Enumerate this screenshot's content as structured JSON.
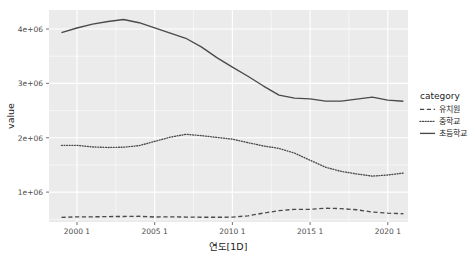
{
  "chart_data": {
    "type": "line",
    "title": "",
    "xlabel": "연도[1D]",
    "ylabel": "value",
    "legend_title": "category",
    "legend_position": "right",
    "grid": true,
    "xlim": [
      1998.2,
      2021.3
    ],
    "ylim": [
      450000,
      4350000
    ],
    "x_ticks": [
      2000,
      2005,
      2010,
      2015,
      2020
    ],
    "x_tick_labels": [
      "2000 1",
      "2005 1",
      "2010 1",
      "2015 1",
      "2020 1"
    ],
    "y_ticks": [
      1000000,
      2000000,
      3000000,
      4000000
    ],
    "y_tick_labels": [
      "1e+06",
      "2e+06",
      "3e+06",
      "4e+06"
    ],
    "x": [
      1999,
      2000,
      2001,
      2002,
      2003,
      2004,
      2005,
      2006,
      2007,
      2008,
      2009,
      2010,
      2011,
      2012,
      2013,
      2014,
      2015,
      2016,
      2017,
      2018,
      2019,
      2020,
      2021
    ],
    "series": [
      {
        "name": "유치원",
        "style": "dashed",
        "color": "#4a4a4a",
        "values": [
          534000,
          545000,
          545000,
          550000,
          552000,
          555000,
          542000,
          545000,
          541000,
          538000,
          537000,
          539000,
          564000,
          614000,
          658000,
          683000,
          683000,
          704000,
          695000,
          675000,
          634000,
          612000,
          602000
        ]
      },
      {
        "name": "중학교",
        "style": "dotted",
        "color": "#4a4a4a",
        "values": [
          1860000,
          1860000,
          1831000,
          1821000,
          1826000,
          1855000,
          1933000,
          2010000,
          2063000,
          2039000,
          2006000,
          1974000,
          1910000,
          1849000,
          1804000,
          1717000,
          1586000,
          1457000,
          1381000,
          1334000,
          1294000,
          1315000,
          1350000
        ]
      },
      {
        "name": "초등학교",
        "style": "solid",
        "color": "#4a4a4a",
        "values": [
          3935000,
          4019000,
          4089000,
          4138000,
          4175000,
          4116000,
          4022000,
          3925000,
          3830000,
          3672000,
          3474000,
          3299000,
          3132000,
          2951000,
          2784000,
          2729000,
          2714000,
          2673000,
          2674000,
          2711000,
          2747000,
          2693000,
          2672000
        ]
      }
    ]
  },
  "legend": {
    "title": "category",
    "items": [
      {
        "label": "유치원",
        "style": "dashed"
      },
      {
        "label": "중학교",
        "style": "dotted"
      },
      {
        "label": "초등학교",
        "style": "solid"
      }
    ]
  },
  "axes": {
    "y_title": "value",
    "x_title": "연도[1D]"
  }
}
